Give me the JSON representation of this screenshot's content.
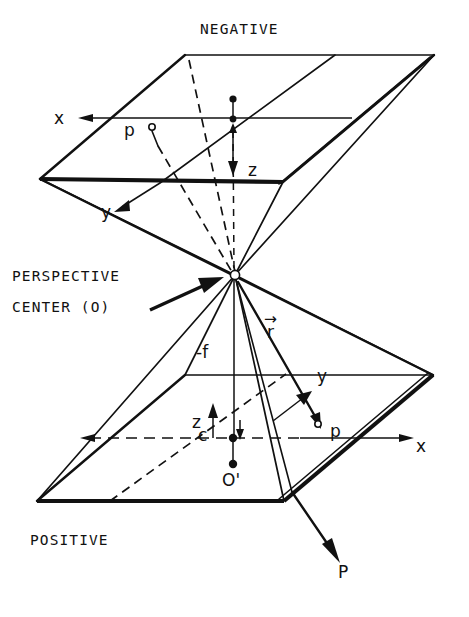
{
  "figure": {
    "background_color": "#ffffff",
    "ink_color": "#111111",
    "width": 469,
    "height": 617
  },
  "labels": {
    "negative_plane": "NEGATIVE",
    "positive_plane": "POSITIVE",
    "perspective_center_line1": "PERSPECTIVE",
    "perspective_center_line2": "CENTER (O)",
    "neg_x_axis": "x",
    "neg_y_axis": "y",
    "neg_z_axis": "z",
    "neg_image_point": "p",
    "pos_x_axis": "x",
    "pos_y_axis": "y",
    "pos_z_axis": "z",
    "pos_image_point": "p",
    "principal_point": "c",
    "focal_length": "-f",
    "ray_vector": "r",
    "ray_vector_arrow": "→",
    "projection_origin": "O'",
    "object_point": "P"
  },
  "annotations": {
    "focal_length_value": "-f",
    "perspective_center_symbol": "O",
    "projection_center_prime": "O'",
    "object_point_symbol": "P",
    "image_point_symbol": "p",
    "principal_point_symbol": "c",
    "ray_symbol": "r"
  },
  "geometry": {
    "negative_plane_corners": [
      [
        185,
        55
      ],
      [
        434,
        55
      ],
      [
        283,
        182
      ],
      [
        40,
        179
      ]
    ],
    "positive_plane_corners": [
      [
        185,
        375
      ],
      [
        433,
        375
      ],
      [
        284,
        501
      ],
      [
        37,
        501
      ]
    ],
    "perspective_center": [
      235,
      275
    ],
    "negative_principal_point": [
      233,
      119
    ],
    "positive_principal_point": [
      233,
      438
    ],
    "projection_origin_point": [
      233,
      464
    ],
    "negative_image_point": [
      152,
      129
    ],
    "positive_image_point": [
      318,
      424
    ]
  }
}
